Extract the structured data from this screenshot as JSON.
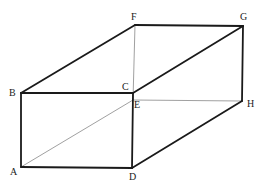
{
  "diagram": {
    "type": "rectangular-prism",
    "vertices": {
      "A": {
        "x": 21,
        "y": 167,
        "label": "A",
        "lx": 10,
        "ly": 175
      },
      "B": {
        "x": 21,
        "y": 93,
        "label": "B",
        "lx": 9,
        "ly": 96
      },
      "C": {
        "x": 133,
        "y": 93,
        "label": "C",
        "lx": 122,
        "ly": 90
      },
      "D": {
        "x": 132,
        "y": 168,
        "label": "D",
        "lx": 129,
        "ly": 180
      },
      "E": {
        "x": 133,
        "y": 100,
        "label": "E",
        "lx": 134,
        "ly": 108
      },
      "F": {
        "x": 135,
        "y": 25,
        "label": "F",
        "lx": 131,
        "ly": 20
      },
      "G": {
        "x": 243,
        "y": 26,
        "label": "G",
        "lx": 240,
        "ly": 20
      },
      "H": {
        "x": 242,
        "y": 101,
        "label": "H",
        "lx": 247,
        "ly": 107
      }
    },
    "edges_visible": [
      [
        "A",
        "B"
      ],
      [
        "B",
        "C"
      ],
      [
        "C",
        "D"
      ],
      [
        "D",
        "A"
      ],
      [
        "B",
        "F"
      ],
      [
        "F",
        "G"
      ],
      [
        "C",
        "G"
      ],
      [
        "G",
        "H"
      ],
      [
        "D",
        "H"
      ]
    ],
    "edges_hidden": [
      [
        "F",
        "E"
      ],
      [
        "E",
        "H"
      ],
      [
        "A",
        "E"
      ]
    ]
  }
}
